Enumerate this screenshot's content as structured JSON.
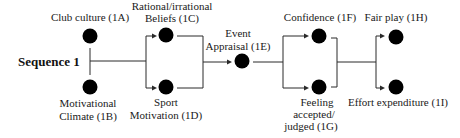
{
  "diagram": {
    "title": "Sequence 1",
    "colors": {
      "node": "#000000",
      "line": "#2a2a2a",
      "text": "#1a1a1a",
      "background": "#ffffff"
    },
    "nodes": [
      {
        "id": "1A",
        "lines": [
          "Club culture (1A)"
        ]
      },
      {
        "id": "1B",
        "lines": [
          "Motivational",
          "Climate (1B)"
        ]
      },
      {
        "id": "1C",
        "lines": [
          "Rational/irrational",
          "Beliefs (1C)"
        ]
      },
      {
        "id": "1D",
        "lines": [
          "Sport",
          "Motivation (1D)"
        ]
      },
      {
        "id": "1E",
        "lines": [
          "Event",
          "Appraisal (1E)"
        ]
      },
      {
        "id": "1F",
        "lines": [
          "Confidence (1F)"
        ]
      },
      {
        "id": "1G",
        "lines": [
          "Feeling",
          "accepted/",
          "judged (1G)"
        ]
      },
      {
        "id": "1H",
        "lines": [
          "Fair play (1H)"
        ]
      },
      {
        "id": "1I",
        "lines": [
          "Effort expenditure (1I)"
        ]
      }
    ],
    "edges": [
      {
        "from": [
          "1A",
          "1B"
        ],
        "to": [
          "1C",
          "1D"
        ]
      },
      {
        "from": [
          "1C",
          "1D"
        ],
        "to": [
          "1E"
        ]
      },
      {
        "from": [
          "1E"
        ],
        "to": [
          "1F",
          "1G"
        ]
      },
      {
        "from": [
          "1F",
          "1G"
        ],
        "to": [
          "1H",
          "1I"
        ]
      }
    ]
  }
}
